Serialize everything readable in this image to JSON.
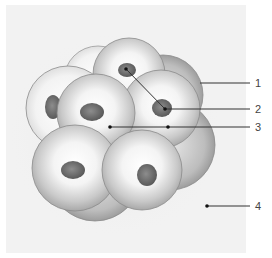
{
  "figure": {
    "background_color": "#f3f3f3",
    "labels": [
      {
        "id": "1",
        "text": "1",
        "line": {
          "x1": 200,
          "y1": 83,
          "x2": 250,
          "y2": 83
        },
        "label_pos": {
          "x": 255,
          "y": 78
        }
      },
      {
        "id": "2",
        "text": "2",
        "line": {
          "x1": 126,
          "y1": 69,
          "x2": 165,
          "y2": 109,
          "x3": 250,
          "y3": 109
        },
        "label_pos": {
          "x": 255,
          "y": 104
        },
        "dots": [
          [
            126,
            69
          ],
          [
            165,
            109
          ]
        ]
      },
      {
        "id": "3",
        "text": "3",
        "line": {
          "x1": 110,
          "y1": 127,
          "x2": 250,
          "y2": 127
        },
        "label_pos": {
          "x": 255,
          "y": 122
        },
        "dots": [
          [
            110,
            127
          ],
          [
            168,
            127
          ]
        ]
      },
      {
        "id": "4",
        "text": "4",
        "line": {
          "x1": 207,
          "y1": 206,
          "x2": 250,
          "y2": 206
        },
        "label_pos": {
          "x": 255,
          "y": 201
        },
        "dots": [
          [
            207,
            206
          ]
        ]
      }
    ],
    "colors": {
      "cell_fill": "#e8e8e8",
      "cell_edge": "#8a8a8a",
      "nucleus": "#6f6f6f",
      "leader": "#333333"
    }
  }
}
